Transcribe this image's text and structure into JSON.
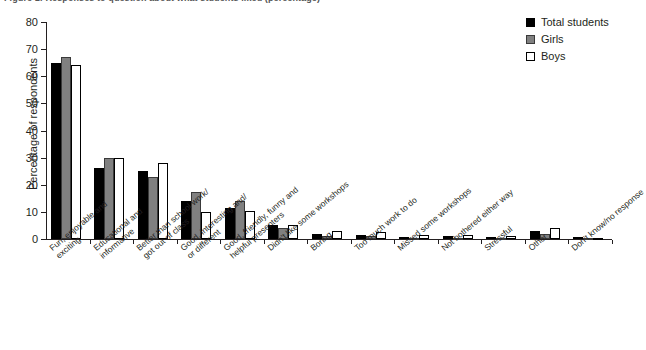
{
  "figure": {
    "caption": "Figure 1: Responses to question about what students liked (percentage)"
  },
  "legend": {
    "position": "top-right",
    "entries": [
      {
        "label": "Total students",
        "color": "#000000",
        "key": "total"
      },
      {
        "label": "Girls",
        "color": "#808080",
        "key": "girls"
      },
      {
        "label": "Boys",
        "color": "#ffffff",
        "key": "boys"
      }
    ]
  },
  "chart_data": {
    "type": "bar",
    "title": "",
    "xlabel": "",
    "ylabel": "Percentage of respondents",
    "ylim": [
      0,
      80
    ],
    "yticks": [
      0,
      10,
      20,
      30,
      40,
      50,
      60,
      70,
      80
    ],
    "grid": false,
    "categories": [
      "Fun, enjoyable and\nexciting",
      "Educational and\ninformative",
      "Better than school work/\ngot out of class",
      "Good, interesting and/\nor different",
      "Good, friendly, funny and\nhelpful presenters",
      "Didn't like some workshops",
      "Boring",
      "Too much work to do",
      "Missed some workshops",
      "Not bothered either way",
      "Stressful",
      "Other",
      "Don't know/no response"
    ],
    "series": [
      {
        "name": "Total students",
        "color": "#000000",
        "values": [
          65,
          26,
          25,
          14,
          11.5,
          5,
          2,
          1.5,
          0.8,
          1,
          0.8,
          3,
          0.8
        ]
      },
      {
        "name": "Girls",
        "color": "#808080",
        "values": [
          67,
          30,
          23,
          17.5,
          14,
          4,
          1,
          1,
          0.5,
          0.5,
          0.5,
          2,
          0.5
        ]
      },
      {
        "name": "Boys",
        "color": "#ffffff",
        "values": [
          64,
          30,
          28,
          10,
          10.5,
          5,
          3,
          2.5,
          1.5,
          1.5,
          1,
          4,
          0.5
        ]
      }
    ]
  }
}
